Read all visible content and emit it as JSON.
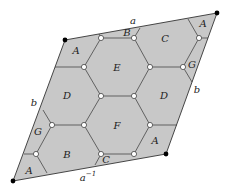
{
  "diagram": {
    "colors": {
      "fill": "#c8c8c8",
      "edge": "#555555",
      "vertex_open": "#ffffff",
      "vertex_corner": "#000000"
    },
    "side_labels": {
      "top": "a",
      "bottom_base": "a",
      "bottom_exp": "−1",
      "left": "b",
      "right": "b"
    },
    "region_labels": [
      {
        "id": "A",
        "text": "A"
      },
      {
        "id": "B",
        "text": "B"
      },
      {
        "id": "C",
        "text": "C"
      },
      {
        "id": "A",
        "text": "A"
      },
      {
        "id": "E",
        "text": "E"
      },
      {
        "id": "G",
        "text": "G"
      },
      {
        "id": "D",
        "text": "D"
      },
      {
        "id": "D",
        "text": "D"
      },
      {
        "id": "F",
        "text": "F"
      },
      {
        "id": "G",
        "text": "G"
      },
      {
        "id": "B",
        "text": "B"
      },
      {
        "id": "A",
        "text": "A"
      },
      {
        "id": "C",
        "text": "C"
      },
      {
        "id": "A",
        "text": "A"
      }
    ]
  }
}
